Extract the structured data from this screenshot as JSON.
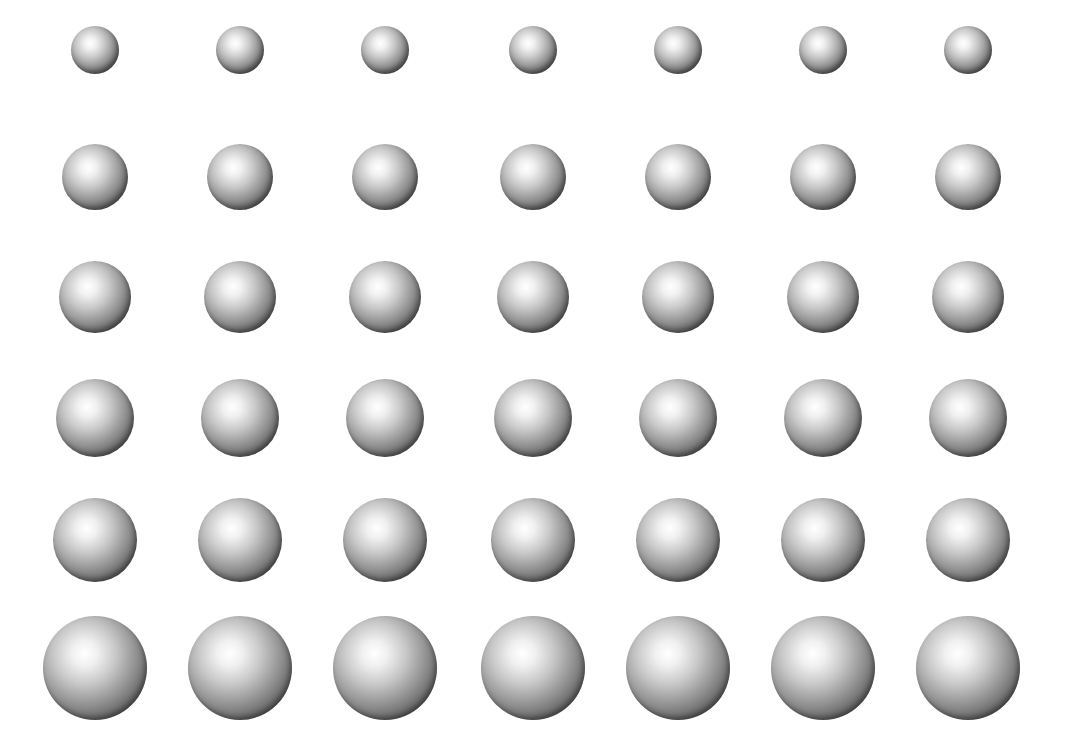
{
  "grid": {
    "background": "#ffffff",
    "columns_x": [
      95,
      240,
      385,
      533,
      678,
      823,
      968
    ],
    "rows": [
      {
        "y": 50,
        "radius": 24
      },
      {
        "y": 177,
        "radius": 33
      },
      {
        "y": 297,
        "radius": 36
      },
      {
        "y": 418,
        "radius": 39
      },
      {
        "y": 540,
        "radius": 42
      },
      {
        "y": 668,
        "radius": 52
      }
    ],
    "sphere_colors": {
      "highlight": "#ffffff",
      "mid": "#9a9a9a",
      "shadow": "#1e1e1e"
    }
  }
}
